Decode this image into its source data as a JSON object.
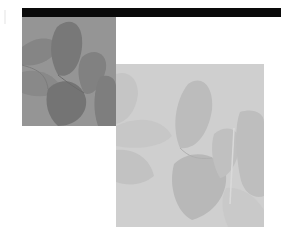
{
  "graphic": {
    "description": "Grayscale decorative composition: black header bar with two overlapping petal photographs",
    "colors": {
      "bar": "#0a0a0a",
      "dark_photo_base": "#8a8a8a",
      "dark_photo_shape": "#6e6e6e",
      "light_photo_base": "#c9c9c9",
      "light_photo_shape": "#b4b4b4",
      "background": "#ffffff"
    },
    "icons": {
      "dark_photo": "petals-photo-icon",
      "light_photo": "petals-photo-icon"
    }
  }
}
